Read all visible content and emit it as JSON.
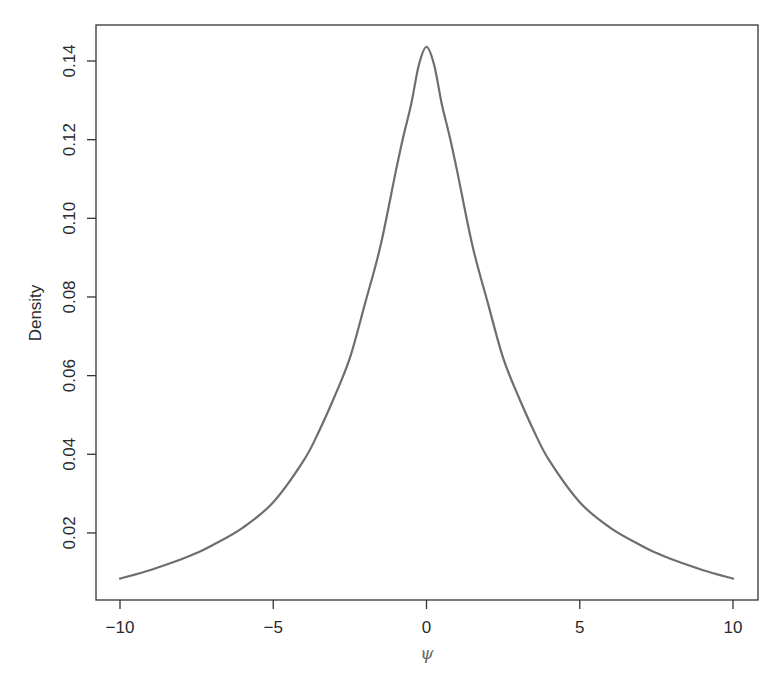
{
  "chart_data": {
    "type": "line",
    "title": "",
    "xlabel": "ψ",
    "ylabel": "Density",
    "xlim": [
      -10,
      10
    ],
    "ylim": [
      0.0084,
      0.1436
    ],
    "grid": false,
    "legend": null,
    "x_ticks": [
      -10,
      -5,
      0,
      5,
      10
    ],
    "x_tick_labels": [
      "−10",
      "−5",
      "0",
      "5",
      "10"
    ],
    "y_ticks": [
      0.02,
      0.04,
      0.06,
      0.08,
      0.1,
      0.12,
      0.14
    ],
    "y_tick_labels": [
      "0.02",
      "0.04",
      "0.06",
      "0.08",
      "0.10",
      "0.12",
      "0.14"
    ],
    "series": [
      {
        "name": "density",
        "color": "#6e6e6e",
        "x": [
          -10,
          -9,
          -8,
          -7.5,
          -7,
          -6,
          -5,
          -4,
          -3.5,
          -3,
          -2.5,
          -2,
          -1.5,
          -1,
          -0.75,
          -0.5,
          -0.25,
          0,
          0.25,
          0.5,
          0.75,
          1,
          1.5,
          2,
          2.5,
          3,
          3.5,
          4,
          5,
          6,
          7,
          7.5,
          8,
          9,
          10
        ],
        "values": [
          0.0084,
          0.0106,
          0.0133,
          0.0149,
          0.0168,
          0.0213,
          0.0278,
          0.0385,
          0.046,
          0.0547,
          0.0645,
          0.0785,
          0.093,
          0.112,
          0.121,
          0.129,
          0.139,
          0.1436,
          0.139,
          0.129,
          0.121,
          0.112,
          0.093,
          0.0785,
          0.0645,
          0.0547,
          0.046,
          0.0385,
          0.0278,
          0.0213,
          0.0168,
          0.0149,
          0.0133,
          0.0106,
          0.0084
        ]
      }
    ]
  },
  "colors": {
    "axis": "#333333",
    "curve": "#6e6e6e",
    "background": "#ffffff"
  }
}
